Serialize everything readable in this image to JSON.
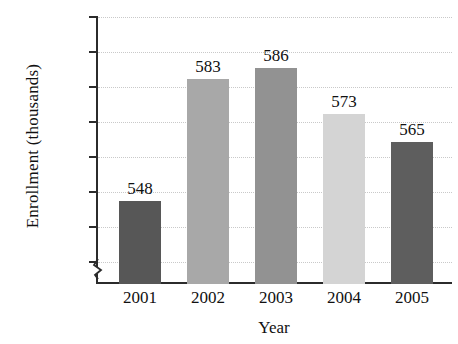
{
  "chart_data": {
    "type": "bar",
    "title": "",
    "xlabel": "Year",
    "ylabel": "Enrollment (thousands)",
    "categories": [
      "2001",
      "2002",
      "2003",
      "2004",
      "2005"
    ],
    "values": [
      548,
      583,
      586,
      573,
      565
    ],
    "value_labels": [
      "548",
      "583",
      "586",
      "573",
      "565"
    ],
    "ylim": [
      525,
      600
    ],
    "yticks": [
      530,
      540,
      550,
      560,
      570,
      580,
      590,
      600
    ],
    "ytick_labels": [
      "530",
      "540",
      "550",
      "560",
      "570",
      "580",
      "590",
      "600"
    ],
    "grid": "horizontal-dotted",
    "legend": "none",
    "axis_break": "y-axis broken below 530",
    "bar_colors": [
      "#575757",
      "#a8a8a8",
      "#929292",
      "#d4d4d4",
      "#5e5e5e"
    ],
    "grid_color": "#c9c9c9",
    "axis_color": "#2b2b2b"
  }
}
